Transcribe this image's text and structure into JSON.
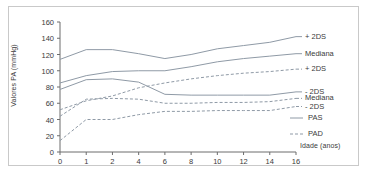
{
  "chart_data": {
    "type": "line",
    "title": "",
    "xlabel": "Idade (anos)",
    "ylabel": "Valores PA (mmHg)",
    "xlim": [
      0,
      16
    ],
    "ylim": [
      0,
      160
    ],
    "grid": false,
    "legend_position": "right",
    "xticks": [
      "0",
      "1",
      "2",
      "4",
      "6",
      "8",
      "10",
      "12",
      "14",
      "16"
    ],
    "xtick_values": [
      0,
      1,
      2,
      4,
      6,
      8,
      10,
      12,
      14,
      16
    ],
    "yticks": [
      "0",
      "20",
      "40",
      "60",
      "80",
      "100",
      "120",
      "140",
      "160"
    ],
    "ytick_values": [
      0,
      20,
      40,
      60,
      80,
      100,
      120,
      140,
      160
    ],
    "x": [
      0,
      1,
      2,
      4,
      6,
      8,
      10,
      12,
      14,
      16
    ],
    "series": [
      {
        "name": "PAS + 2DS",
        "group": "PAS",
        "band": "+ 2DS",
        "style": "solid",
        "color": "#8f9aa6",
        "end_label": "+ 2DS",
        "values": [
          114,
          126,
          126,
          121,
          115,
          120,
          127,
          131,
          135,
          142
        ]
      },
      {
        "name": "PAS Mediana",
        "group": "PAS",
        "band": "Mediana",
        "style": "solid",
        "color": "#8f9aa6",
        "end_label": "Mediana",
        "values": [
          85,
          94,
          99,
          100,
          100,
          105,
          111,
          115,
          118,
          121
        ]
      },
      {
        "name": "PAS - 2DS",
        "group": "PAS",
        "band": "- 2DS",
        "style": "solid",
        "color": "#8f9aa6",
        "end_label": "- 2DS",
        "values": [
          77,
          89,
          90,
          86,
          71,
          70,
          70,
          70,
          70,
          74
        ]
      },
      {
        "name": "PAD + 2DS",
        "group": "PAD",
        "band": "+ 2DS",
        "style": "dashed",
        "color": "#8f9aa6",
        "end_label": "+ 2DS",
        "values": [
          52,
          63,
          69,
          79,
          85,
          90,
          94,
          97,
          99,
          102
        ]
      },
      {
        "name": "PAD Mediana",
        "group": "PAD",
        "band": "Mediana",
        "style": "dashed",
        "color": "#8f9aa6",
        "end_label": "Mediana",
        "values": [
          44,
          65,
          66,
          65,
          60,
          60,
          61,
          61,
          62,
          66
        ]
      },
      {
        "name": "PAD - 2DS",
        "group": "PAD",
        "band": "- 2DS",
        "style": "dashed",
        "color": "#8f9aa6",
        "end_label": "- 2DS",
        "values": [
          14,
          40,
          40,
          46,
          50,
          50,
          51,
          51,
          51,
          56
        ]
      }
    ],
    "legend": [
      {
        "label": "PAS",
        "style": "solid"
      },
      {
        "label": "PAD",
        "style": "dashed"
      }
    ]
  }
}
